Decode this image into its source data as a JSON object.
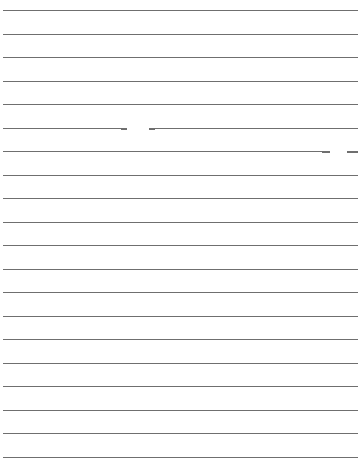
{
  "page": {
    "type": "lined-paper",
    "background": "#ffffff",
    "line_color": "#6f6f6f",
    "line_count": 20,
    "first_line_y": 10,
    "line_spacing": 23.5,
    "line_left": 3,
    "line_right": 358
  },
  "lines": [
    {
      "index": 1
    },
    {
      "index": 2
    },
    {
      "index": 3
    },
    {
      "index": 4
    },
    {
      "index": 5
    },
    {
      "index": 6,
      "gap": {
        "start": 127,
        "end": 149
      }
    },
    {
      "index": 7,
      "end": 330,
      "extra_dash": {
        "start": 347,
        "end": 358
      }
    },
    {
      "index": 8
    },
    {
      "index": 9
    },
    {
      "index": 10
    },
    {
      "index": 11
    },
    {
      "index": 12
    },
    {
      "index": 13
    },
    {
      "index": 14
    },
    {
      "index": 15
    },
    {
      "index": 16
    },
    {
      "index": 17
    },
    {
      "index": 18
    },
    {
      "index": 19
    },
    {
      "index": 20
    }
  ]
}
